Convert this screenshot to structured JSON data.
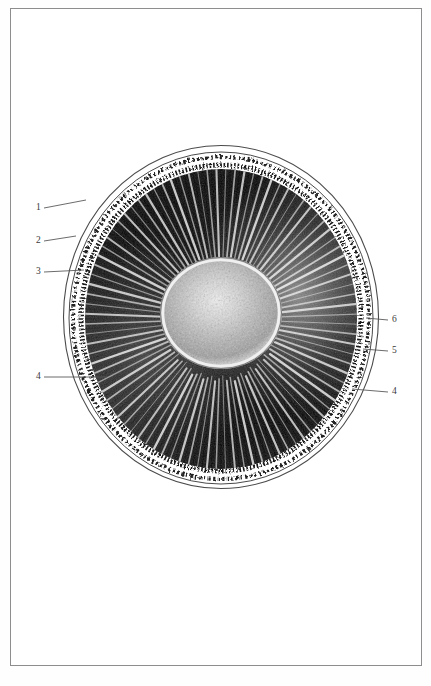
{
  "plate": {
    "background_color": "#ffffff",
    "border_color": "#8d8d8d",
    "ink_color": "#121212",
    "label_color": "#3a3a3a",
    "leader_color": "#5a5a5a"
  },
  "figure": {
    "name": "radially-striated-circular-section",
    "center_x": 221,
    "center_y": 317,
    "outer_radius_x": 158,
    "outer_radius_y": 172,
    "core_radius_x": 57,
    "core_radius_y": 52,
    "ray_count": 92
  },
  "labels": [
    {
      "id": "label-1",
      "text": "1",
      "text_x": 36,
      "text_y": 203,
      "line_x1": 44,
      "line_y1": 208,
      "line_x2": 86,
      "line_y2": 200
    },
    {
      "id": "label-2",
      "text": "2",
      "text_x": 36,
      "text_y": 236,
      "line_x1": 44,
      "line_y1": 241,
      "line_x2": 76,
      "line_y2": 236
    },
    {
      "id": "label-3",
      "text": "3",
      "text_x": 36,
      "text_y": 267,
      "line_x1": 44,
      "line_y1": 272,
      "line_x2": 84,
      "line_y2": 270
    },
    {
      "id": "label-4-left",
      "text": "4",
      "text_x": 36,
      "text_y": 372,
      "line_x1": 44,
      "line_y1": 377,
      "line_x2": 107,
      "line_y2": 377
    },
    {
      "id": "label-6-right",
      "text": "6",
      "text_x": 392,
      "text_y": 315,
      "line_x1": 388,
      "line_y1": 320,
      "line_x2": 366,
      "line_y2": 318
    },
    {
      "id": "label-5-right",
      "text": "5",
      "text_x": 392,
      "text_y": 346,
      "line_x1": 388,
      "line_y1": 351,
      "line_x2": 363,
      "line_y2": 349
    },
    {
      "id": "label-4-right",
      "text": "4",
      "text_x": 392,
      "text_y": 387,
      "line_x1": 388,
      "line_y1": 392,
      "line_x2": 352,
      "line_y2": 389
    }
  ]
}
